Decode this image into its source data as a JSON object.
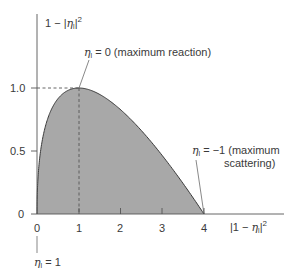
{
  "chart_data": {
    "type": "area",
    "title": "",
    "xlabel": "|1 − η_l|²",
    "ylabel": "1 − |η_l|²",
    "x_ticks": [
      "0",
      "1",
      "2",
      "3",
      "4"
    ],
    "y_ticks": [
      "0",
      "0.5",
      "1.0"
    ],
    "xlim": [
      0,
      4
    ],
    "ylim": [
      0,
      1.0
    ],
    "grid": false,
    "legend": null,
    "curve_formula": "y = 2*sqrt(x) - x",
    "x": [
      0,
      0.01,
      0.05,
      0.1,
      0.25,
      0.5,
      1.0,
      1.5,
      2.0,
      2.5,
      3.0,
      3.5,
      4.0
    ],
    "values": [
      0,
      0.19,
      0.397,
      0.532,
      0.75,
      0.914,
      1.0,
      0.949,
      0.828,
      0.662,
      0.464,
      0.242,
      0
    ],
    "fill_color": "#a8a8a8",
    "line_color": "#3a3a3a",
    "annotations": [
      {
        "text": "η_l = 0 (maximum reaction)",
        "points_to": [
          1,
          1.0
        ]
      },
      {
        "text": "η_l = −1 (maximum scattering)",
        "points_to": [
          4,
          0
        ]
      },
      {
        "text": "η_l = 1",
        "points_to": [
          0,
          0
        ]
      }
    ],
    "reference_lines": [
      {
        "type": "dashed-horizontal",
        "y": 1.0,
        "from_x": 0,
        "to_x": 1
      },
      {
        "type": "dashed-vertical",
        "x": 1,
        "from_y": 0,
        "to_y": 1.0
      }
    ]
  },
  "labels": {
    "y_axis_prefix": "1 − |",
    "y_axis_eta": "η",
    "y_axis_sub": "l",
    "y_axis_suffix": "|",
    "y_axis_sup": "2",
    "x_axis_prefix": "|1 − ",
    "x_axis_eta": "η",
    "x_axis_sub": "l",
    "x_axis_suffix": "|",
    "x_axis_sup": "2",
    "ann_reaction_eta": "η",
    "ann_reaction_sub": "l",
    "ann_reaction_text": " = 0 (maximum reaction)",
    "ann_scatter_eta": "η",
    "ann_scatter_sub": "l",
    "ann_scatter_text1": " = −1 (maximum",
    "ann_scatter_text2": "scattering)",
    "ann_one_eta": "η",
    "ann_one_sub": "l",
    "ann_one_text": " = 1",
    "tick_x0": "0",
    "tick_x1": "1",
    "tick_x2": "2",
    "tick_x3": "3",
    "tick_x4": "4",
    "tick_y0": "0",
    "tick_y05": "0.5",
    "tick_y10": "1.0"
  }
}
